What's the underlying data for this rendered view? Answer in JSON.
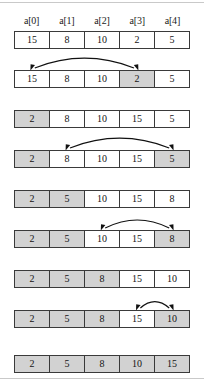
{
  "figure": {
    "array_length": 5,
    "colors": {
      "cell_border": "#3a3a3a",
      "shaded_fill": "#d2d2d2",
      "plain_fill": "#ffffff",
      "arrow": "#111111",
      "rule": "#c9c9c9",
      "text": "#141414"
    },
    "headers": [
      "a[0]",
      "a[1]",
      "a[2]",
      "a[3]",
      "a[4]"
    ],
    "rows": [
      {
        "name": "row-initial",
        "values": [
          "15",
          "8",
          "10",
          "2",
          "5"
        ],
        "shaded": [
          false,
          false,
          false,
          false,
          false
        ],
        "arrow": null
      },
      {
        "name": "row-swap-0-3",
        "values": [
          "15",
          "8",
          "10",
          "2",
          "5"
        ],
        "shaded": [
          false,
          false,
          false,
          true,
          false
        ],
        "arrow": {
          "from": 0,
          "to": 3
        }
      },
      {
        "name": "row-after-swap-1",
        "values": [
          "2",
          "8",
          "10",
          "15",
          "5"
        ],
        "shaded": [
          true,
          false,
          false,
          false,
          false
        ],
        "arrow": null
      },
      {
        "name": "row-swap-1-4",
        "values": [
          "2",
          "8",
          "10",
          "15",
          "5"
        ],
        "shaded": [
          true,
          false,
          false,
          false,
          true
        ],
        "arrow": {
          "from": 1,
          "to": 4
        }
      },
      {
        "name": "row-after-swap-2",
        "values": [
          "2",
          "5",
          "10",
          "15",
          "8"
        ],
        "shaded": [
          true,
          true,
          false,
          false,
          false
        ],
        "arrow": null
      },
      {
        "name": "row-swap-2-4",
        "values": [
          "2",
          "5",
          "10",
          "15",
          "8"
        ],
        "shaded": [
          true,
          true,
          false,
          false,
          true
        ],
        "arrow": {
          "from": 2,
          "to": 4
        }
      },
      {
        "name": "row-after-swap-3",
        "values": [
          "2",
          "5",
          "8",
          "15",
          "10"
        ],
        "shaded": [
          true,
          true,
          true,
          false,
          false
        ],
        "arrow": null
      },
      {
        "name": "row-swap-3-4",
        "values": [
          "2",
          "5",
          "8",
          "15",
          "10"
        ],
        "shaded": [
          true,
          true,
          true,
          false,
          true
        ],
        "arrow": {
          "from": 3,
          "to": 4
        }
      },
      {
        "name": "row-sorted",
        "values": [
          "2",
          "5",
          "8",
          "10",
          "15"
        ],
        "shaded": [
          true,
          true,
          true,
          true,
          true
        ],
        "arrow": null
      }
    ]
  }
}
